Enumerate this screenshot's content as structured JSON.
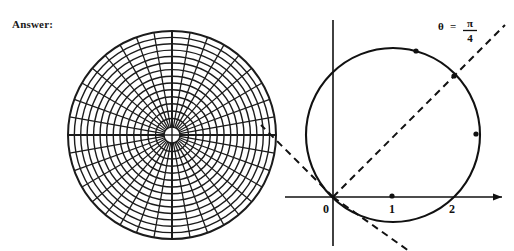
{
  "page": {
    "answer_label": "Answer:",
    "background_color": "#ffffff",
    "ink_color": "#111111"
  },
  "chart_data": [
    {
      "type": "polar-grid",
      "title": "",
      "name": "polar-coordinate-grid",
      "description": "Polar graph paper: concentric circles and radial spokes around a central hole",
      "center": [
        172,
        135
      ],
      "outer_radius": 104,
      "inner_hole_radius": 8,
      "radial_spokes": 36,
      "spoke_angle_step_degrees": 10,
      "concentric_circles": 14,
      "grid": true,
      "xlabel": "",
      "ylabel": "",
      "tick_labels": []
    },
    {
      "type": "line",
      "name": "polar-circle-r-equals-2cos-theta",
      "title": "",
      "description": "Cartesian axes with the polar curve r = 2 cos(theta), a circle through the origin centered at (1,0) with radius 1, plus the dashed line theta = pi/4 and its extension",
      "xlabel": "",
      "ylabel": "",
      "xlim": [
        -0.6,
        2.0
      ],
      "ylim": [
        -1.4,
        1.4
      ],
      "grid": false,
      "x_tick_labels": [
        "0",
        "1",
        "2"
      ],
      "x_tick_values": [
        0,
        1,
        2
      ],
      "y_tick_labels": [],
      "annotations": [
        {
          "text": "theta = pi/4",
          "theta_symbol": "θ",
          "equals": "=",
          "numerator": "π",
          "denominator": "4",
          "position": [
            1.45,
            1.2
          ]
        }
      ],
      "series": [
        {
          "name": "r = 2 cos(theta)",
          "style": "solid",
          "closed": true,
          "center": [
            1,
            0
          ],
          "radius": 1
        },
        {
          "name": "theta = pi/4 ray",
          "style": "dashed",
          "slope": 1,
          "through": [
            0,
            0
          ]
        },
        {
          "name": "theta = pi/4 extension (negative r)",
          "style": "dashed",
          "slope": -1,
          "through": [
            0,
            0
          ]
        }
      ],
      "marked_points": [
        {
          "label": "",
          "x": 1.0,
          "y": 0.0
        },
        {
          "label": "",
          "x": 1.41,
          "y": 0.955
        },
        {
          "label": "",
          "x": 1.965,
          "y": 0.72
        },
        {
          "label": "",
          "x": 0.69,
          "y": 0.47
        }
      ]
    }
  ]
}
